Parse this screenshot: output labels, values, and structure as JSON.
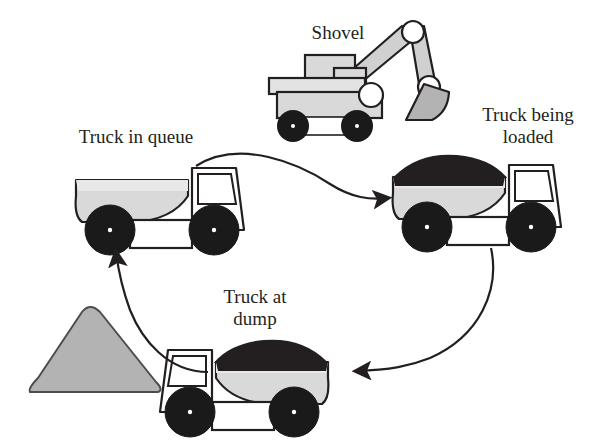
{
  "diagram": {
    "background_color": "#ffffff",
    "stroke_color": "#231f20",
    "body_fill": "#d9d9d9",
    "load_fill": "#231f20",
    "wheel_fill": "#1a1a1a",
    "pile_fill": "#b3b3b3",
    "white_fill": "#ffffff"
  },
  "labels": {
    "shovel": "Shovel",
    "truck_in_queue": "Truck in queue",
    "truck_being_loaded": "Truck being\nloaded",
    "truck_at_dump": "Truck at\ndump"
  },
  "nodes": [
    {
      "id": "shovel",
      "name": "shovel-excavator",
      "label": "Shovel"
    },
    {
      "id": "truck-queue",
      "name": "truck-in-queue",
      "label": "Truck in queue",
      "loaded": "empty"
    },
    {
      "id": "truck-loaded",
      "name": "truck-being-loaded",
      "label": "Truck being loaded",
      "loaded": "full"
    },
    {
      "id": "truck-dump",
      "name": "truck-at-dump",
      "label": "Truck at dump",
      "loaded": "full"
    },
    {
      "id": "pile",
      "name": "dump-pile",
      "label": ""
    }
  ],
  "arrows": [
    {
      "id": "arrow-queue-to-loading",
      "from": "truck-in-queue",
      "to": "truck-being-loaded",
      "direction": "right"
    },
    {
      "id": "arrow-loading-to-dump",
      "from": "truck-being-loaded",
      "to": "truck-at-dump",
      "direction": "left"
    },
    {
      "id": "arrow-dump-to-queue",
      "from": "truck-at-dump",
      "to": "truck-in-queue",
      "direction": "up"
    }
  ]
}
